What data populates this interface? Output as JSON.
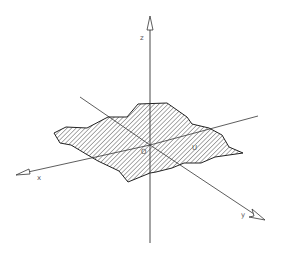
{
  "figure": {
    "type": "3d-axes-diagram",
    "colors": {
      "line": "#333333",
      "hatch": "#444444",
      "background": "#ffffff",
      "label": "#555555"
    },
    "axes": {
      "z": {
        "label": "z"
      },
      "x": {
        "label": "x"
      },
      "y": {
        "label": "y"
      }
    },
    "origin_label": "O",
    "region_label": "U"
  }
}
